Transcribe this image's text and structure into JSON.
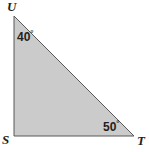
{
  "figure": {
    "name": "triangle-STU",
    "type": "right-triangle",
    "background_color": "#ffffff",
    "fill_color": "#cbcbcb",
    "stroke_color": "#58595b",
    "stroke_width": 1,
    "vertices": [
      {
        "id": "U",
        "label": "U",
        "x": 14,
        "y": 16
      },
      {
        "id": "S",
        "label": "S",
        "x": 14,
        "y": 136
      },
      {
        "id": "T",
        "label": "T",
        "x": 134,
        "y": 136
      }
    ],
    "angles": [
      {
        "at": "U",
        "value": 40,
        "label": "40",
        "degree_symbol": "°"
      },
      {
        "at": "T",
        "value": 50,
        "label": "50",
        "degree_symbol": "°"
      },
      {
        "at": "S",
        "value": 90,
        "label": "",
        "degree_symbol": ""
      }
    ],
    "vertex_labels": {
      "U": "U",
      "S": "S",
      "T": "T"
    }
  }
}
